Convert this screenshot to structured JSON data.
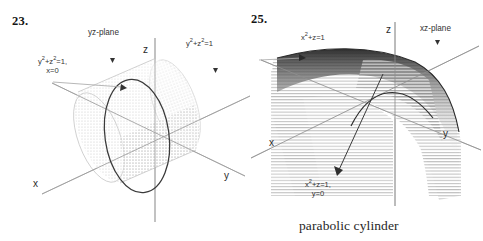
{
  "page": {
    "background_color": "#ffffff",
    "ink_color": "#2b2b2b"
  },
  "figures": [
    {
      "id": "figure-23",
      "number": "23.",
      "surface": "circular cylinder",
      "axes": {
        "x": "x",
        "y": "y",
        "z": "z"
      },
      "labels": {
        "plane": "yz-plane",
        "trace_equation_line1": "y",
        "trace_equation_sup1": "2",
        "trace_equation_mid": "+z",
        "trace_equation_sup2": "2",
        "trace_equation_end": "=1,",
        "trace_equation_line2": "x=0",
        "surface_equation_a": "y",
        "surface_equation_sup_a": "2",
        "surface_equation_b": "+z",
        "surface_equation_sup_b": "2",
        "surface_equation_c": "=1"
      }
    },
    {
      "id": "figure-25",
      "number": "25.",
      "surface": "parabolic cylinder",
      "axes": {
        "x": "x",
        "y": "y",
        "z": "z"
      },
      "labels": {
        "plane": "xz-plane",
        "surface_equation_a": "x",
        "surface_equation_sup_a": "2",
        "surface_equation_b": "+z=1",
        "trace_equation_a": "x",
        "trace_equation_sup_a": "2",
        "trace_equation_b": "+z=1,",
        "trace_equation_line2": "y=0"
      },
      "caption": "parabolic cylinder"
    }
  ]
}
